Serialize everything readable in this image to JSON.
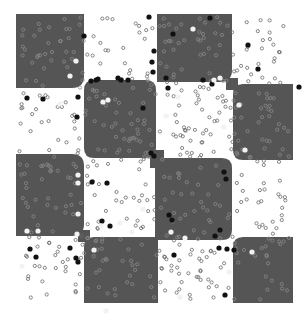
{
  "image": {
    "description": "Micrograph-like checkerboard pattern of dark gray rounded squares on white, scattered with small open circles and dark/bright particles",
    "width": 307,
    "height": 317,
    "background": "#ffffff",
    "block_color": "#555555",
    "ring_on_dark": "#8a8a8a",
    "ring_on_light": "#6a6a6a",
    "particle_dark": "#111111",
    "particle_bright": "#f2f2f2"
  },
  "blocks": [
    {
      "x": 16,
      "y": 14,
      "w": 68,
      "h": 74,
      "r": [
        0,
        0,
        12,
        0
      ]
    },
    {
      "x": 157,
      "y": 14,
      "w": 75,
      "h": 68,
      "r": [
        0,
        0,
        12,
        0
      ]
    },
    {
      "x": 84,
      "y": 80,
      "w": 72,
      "h": 78,
      "r": [
        10,
        10,
        10,
        10
      ]
    },
    {
      "x": 233,
      "y": 84,
      "w": 60,
      "h": 76,
      "r": [
        10,
        0,
        0,
        10
      ]
    },
    {
      "x": 16,
      "y": 154,
      "w": 68,
      "h": 82,
      "r": [
        0,
        12,
        12,
        0
      ]
    },
    {
      "x": 155,
      "y": 158,
      "w": 77,
      "h": 82,
      "r": [
        0,
        10,
        10,
        0
      ]
    },
    {
      "x": 84,
      "y": 237,
      "w": 74,
      "h": 66,
      "r": [
        10,
        0,
        0,
        0
      ]
    },
    {
      "x": 233,
      "y": 237,
      "w": 60,
      "h": 66,
      "r": [
        10,
        0,
        0,
        0
      ]
    }
  ],
  "bridges": [
    {
      "x": 150,
      "y": 150,
      "w": 14,
      "h": 18
    },
    {
      "x": 78,
      "y": 230,
      "w": 12,
      "h": 12
    },
    {
      "x": 226,
      "y": 78,
      "w": 12,
      "h": 12
    }
  ],
  "content_area": {
    "x": 16,
    "y": 14,
    "w": 277,
    "h": 289
  },
  "particles": {
    "rings_per_light_cell": 40,
    "rings_per_dark_cell": 32,
    "dark_dots": [
      [
        27,
        98
      ],
      [
        78,
        97
      ],
      [
        77,
        117
      ],
      [
        84,
        36
      ],
      [
        98,
        79
      ],
      [
        118,
        78
      ],
      [
        149,
        17
      ],
      [
        154,
        51
      ],
      [
        152,
        62
      ],
      [
        153,
        72
      ],
      [
        91,
        81
      ],
      [
        96,
        80
      ],
      [
        121,
        80
      ],
      [
        128,
        80
      ],
      [
        166,
        78
      ],
      [
        203,
        80
      ],
      [
        173,
        34
      ],
      [
        212,
        84
      ],
      [
        143,
        108
      ],
      [
        215,
        236
      ],
      [
        220,
        230
      ],
      [
        168,
        88
      ],
      [
        43,
        99
      ],
      [
        92,
        182
      ],
      [
        107,
        183
      ],
      [
        102,
        221
      ],
      [
        110,
        226
      ],
      [
        169,
        215
      ],
      [
        172,
        220
      ],
      [
        226,
        179
      ],
      [
        224,
        172
      ],
      [
        30,
        249
      ],
      [
        36,
        257
      ],
      [
        70,
        248
      ],
      [
        76,
        258
      ],
      [
        78,
        262
      ],
      [
        234,
        250
      ],
      [
        219,
        248
      ],
      [
        227,
        249
      ],
      [
        174,
        255
      ],
      [
        151,
        153
      ],
      [
        154,
        156
      ],
      [
        225,
        295
      ],
      [
        248,
        45
      ],
      [
        258,
        69
      ],
      [
        299,
        87
      ],
      [
        210,
        18
      ]
    ],
    "bright_dots": [
      [
        76,
        61
      ],
      [
        70,
        76
      ],
      [
        60,
        104
      ],
      [
        103,
        102
      ],
      [
        108,
        100
      ],
      [
        120,
        223
      ],
      [
        143,
        209
      ],
      [
        101,
        226
      ],
      [
        94,
        250
      ],
      [
        166,
        116
      ],
      [
        224,
        127
      ],
      [
        193,
        29
      ],
      [
        214,
        80
      ],
      [
        220,
        78
      ],
      [
        178,
        97
      ],
      [
        239,
        105
      ],
      [
        245,
        150
      ],
      [
        229,
        272
      ],
      [
        252,
        252
      ],
      [
        171,
        232
      ],
      [
        132,
        232
      ],
      [
        78,
        175
      ],
      [
        78,
        183
      ],
      [
        78,
        214
      ],
      [
        77,
        234
      ],
      [
        27,
        231
      ],
      [
        38,
        231
      ],
      [
        22,
        266
      ],
      [
        185,
        238
      ],
      [
        106,
        311
      ],
      [
        180,
        297
      ]
    ]
  }
}
